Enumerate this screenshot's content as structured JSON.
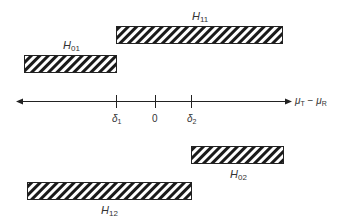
{
  "diagram": {
    "axis": {
      "label_main": "μ",
      "label_sub1": "T",
      "label_minus": " − ",
      "label_main2": "μ",
      "label_sub2": "R",
      "ticks": [
        {
          "name": "delta-1",
          "main": "δ",
          "sub": "1"
        },
        {
          "name": "zero",
          "main": "0",
          "sub": ""
        },
        {
          "name": "delta-2",
          "main": "δ",
          "sub": "2"
        }
      ]
    },
    "regions": [
      {
        "name": "H11",
        "main": "H",
        "sub": "11",
        "description": "hatched bar from δ1 extending right"
      },
      {
        "name": "H01",
        "main": "H",
        "sub": "01",
        "description": "hatched bar extending left up to δ1"
      },
      {
        "name": "H02",
        "main": "H",
        "sub": "02",
        "description": "hatched bar from δ2 extending right"
      },
      {
        "name": "H12",
        "main": "H",
        "sub": "12",
        "description": "hatched bar extending left up to δ2"
      }
    ],
    "colors": {
      "line": "#222222",
      "hatch": "#1a1a1a",
      "background": "#ffffff"
    }
  }
}
